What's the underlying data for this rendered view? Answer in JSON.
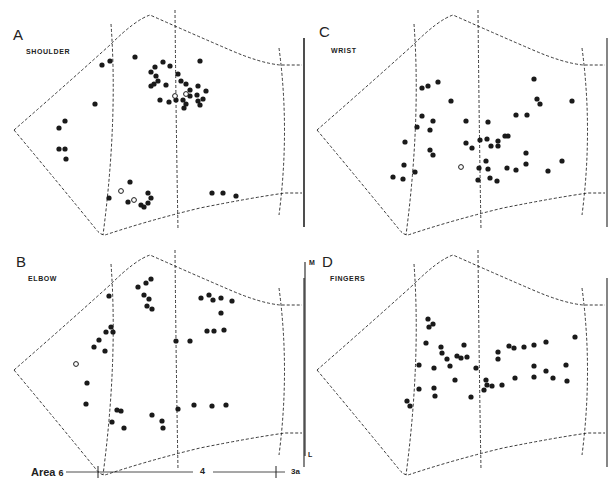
{
  "figure": {
    "panels": [
      {
        "letter": "A",
        "name": "SHOULDER",
        "offset": [
          0,
          0
        ],
        "filled": [
          [
            102,
            65
          ],
          [
            110,
            61
          ],
          [
            135,
            57
          ],
          [
            95,
            104
          ],
          [
            65,
            121
          ],
          [
            59,
            128
          ],
          [
            59,
            149
          ],
          [
            65,
            149
          ],
          [
            66,
            159
          ],
          [
            151,
            72
          ],
          [
            155,
            67
          ],
          [
            163,
            62
          ],
          [
            170,
            66
          ],
          [
            178,
            74
          ],
          [
            151,
            86
          ],
          [
            154,
            84
          ],
          [
            158,
            81
          ],
          [
            156,
            76
          ],
          [
            166,
            85
          ],
          [
            181,
            81
          ],
          [
            186,
            84
          ],
          [
            198,
            86
          ],
          [
            190,
            90
          ],
          [
            206,
            91
          ],
          [
            197,
            95
          ],
          [
            190,
            96
          ],
          [
            183,
            100
          ],
          [
            176,
            100
          ],
          [
            186,
            104
          ],
          [
            198,
            101
          ],
          [
            203,
            99
          ],
          [
            200,
            105
          ],
          [
            184,
            108
          ],
          [
            160,
            100
          ],
          [
            169,
            102
          ],
          [
            200,
            61
          ],
          [
            130,
            182
          ],
          [
            109,
            198
          ],
          [
            128,
            202
          ],
          [
            141,
            205
          ],
          [
            144,
            207
          ],
          [
            148,
            203
          ],
          [
            151,
            198
          ],
          [
            148,
            193
          ],
          [
            212,
            193
          ],
          [
            223,
            193
          ],
          [
            236,
            196
          ]
        ],
        "open": [
          [
            175,
            96
          ],
          [
            186,
            94
          ],
          [
            121,
            191
          ],
          [
            134,
            200
          ]
        ]
      },
      {
        "letter": "C",
        "name": "WRIST",
        "offset": [
          300,
          0
        ],
        "filled": [
          [
            422,
            88
          ],
          [
            428,
            86
          ],
          [
            438,
            82
          ],
          [
            451,
            101
          ],
          [
            422,
            116
          ],
          [
            433,
            121
          ],
          [
            417,
            127
          ],
          [
            430,
            130
          ],
          [
            405,
            142
          ],
          [
            430,
            150
          ],
          [
            433,
            155
          ],
          [
            404,
            165
          ],
          [
            415,
            172
          ],
          [
            393,
            177
          ],
          [
            403,
            179
          ],
          [
            466,
            143
          ],
          [
            472,
            148
          ],
          [
            466,
            121
          ],
          [
            488,
            122
          ],
          [
            480,
            140
          ],
          [
            487,
            139
          ],
          [
            491,
            146
          ],
          [
            498,
            141
          ],
          [
            508,
            136
          ],
          [
            505,
            136
          ],
          [
            498,
            146
          ],
          [
            479,
            168
          ],
          [
            486,
            161
          ],
          [
            478,
            180
          ],
          [
            488,
            169
          ],
          [
            490,
            178
          ],
          [
            497,
            181
          ],
          [
            507,
            168
          ],
          [
            516,
            170
          ],
          [
            534,
            79
          ],
          [
            537,
            99
          ],
          [
            540,
            104
          ],
          [
            572,
            101
          ],
          [
            516,
            115
          ],
          [
            527,
            115
          ],
          [
            526,
            153
          ],
          [
            526,
            164
          ],
          [
            548,
            171
          ],
          [
            562,
            161
          ]
        ],
        "open": [
          [
            461,
            167
          ]
        ]
      },
      {
        "letter": "B",
        "name": "ELBOW",
        "offset": [
          0,
          240
        ],
        "filled": [
          [
            109,
            296
          ],
          [
            138,
            287
          ],
          [
            146,
            283
          ],
          [
            151,
            279
          ],
          [
            144,
            295
          ],
          [
            149,
            299
          ],
          [
            147,
            306
          ],
          [
            152,
            309
          ],
          [
            106,
            332
          ],
          [
            111,
            327
          ],
          [
            113,
            332
          ],
          [
            99,
            340
          ],
          [
            94,
            347
          ],
          [
            105,
            351
          ],
          [
            87,
            383
          ],
          [
            86,
            404
          ],
          [
            117,
            410
          ],
          [
            112,
            422
          ],
          [
            121,
            411
          ],
          [
            124,
            428
          ],
          [
            152,
            415
          ],
          [
            162,
            421
          ],
          [
            163,
            428
          ],
          [
            176,
            341
          ],
          [
            190,
            341
          ],
          [
            201,
            298
          ],
          [
            209,
            295
          ],
          [
            213,
            300
          ],
          [
            221,
            298
          ],
          [
            221,
            313
          ],
          [
            232,
            301
          ],
          [
            207,
            331
          ],
          [
            214,
            331
          ],
          [
            224,
            330
          ],
          [
            178,
            409
          ],
          [
            194,
            405
          ],
          [
            212,
            406
          ],
          [
            226,
            405
          ]
        ],
        "open": [
          [
            76,
            364
          ]
        ]
      },
      {
        "letter": "D",
        "name": "FINGERS",
        "offset": [
          300,
          240
        ],
        "filled": [
          [
            407,
            401
          ],
          [
            410,
            406
          ],
          [
            428,
            319
          ],
          [
            429,
            327
          ],
          [
            433,
            324
          ],
          [
            426,
            343
          ],
          [
            419,
            365
          ],
          [
            419,
            389
          ],
          [
            434,
            368
          ],
          [
            434,
            388
          ],
          [
            435,
            396
          ],
          [
            441,
            347
          ],
          [
            442,
            353
          ],
          [
            447,
            359
          ],
          [
            450,
            366
          ],
          [
            455,
            380
          ],
          [
            457,
            356
          ],
          [
            461,
            358
          ],
          [
            464,
            345
          ],
          [
            467,
            357
          ],
          [
            471,
            397
          ],
          [
            476,
            368
          ],
          [
            484,
            390
          ],
          [
            486,
            380
          ],
          [
            487,
            385
          ],
          [
            492,
            386
          ],
          [
            498,
            352
          ],
          [
            498,
            359
          ],
          [
            502,
            385
          ],
          [
            509,
            346
          ],
          [
            514,
            348
          ],
          [
            515,
            378
          ],
          [
            524,
            347
          ],
          [
            534,
            345
          ],
          [
            534,
            366
          ],
          [
            534,
            377
          ],
          [
            546,
            342
          ],
          [
            546,
            371
          ],
          [
            553,
            378
          ],
          [
            566,
            365
          ],
          [
            567,
            381
          ],
          [
            575,
            337
          ]
        ],
        "open": []
      }
    ],
    "axis": {
      "medial_label": "M",
      "lateral_label": "L"
    },
    "area_scale": {
      "area_prefix": "Area",
      "left_area": "6",
      "middle_area": "4",
      "right_area": "3a"
    },
    "colors": {
      "ink": "#1a1a1a",
      "background": "#ffffff"
    }
  }
}
